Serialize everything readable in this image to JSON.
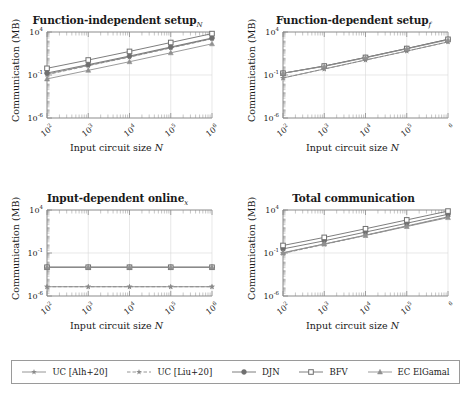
{
  "figure": {
    "width": 471,
    "height": 394,
    "background": "#ffffff",
    "line_color": "#808080",
    "axis_color": "#8c8c8c",
    "grid_color": "#d9d9d9",
    "text_color": "#1a1a1a"
  },
  "panels": [
    {
      "key": "function_independent_setup",
      "title": "Function-independent setup",
      "title_sub": "N",
      "xlabel_prefix": "Input circuit size ",
      "xlabel_italic": "N",
      "ylabel": "Communication (MB)",
      "xticks": [
        "10<sup>2</sup>",
        "10<sup>3</sup>",
        "10<sup>4</sup>",
        "10<sup>5</sup>",
        "10<sup>6</sup>"
      ],
      "yticks": [
        "10<sup>4</sup>",
        "10<sup>-1</sup>",
        "10<sup>-6</sup>"
      ]
    },
    {
      "key": "function_dependent_setup",
      "title": "Function-dependent setup",
      "title_sub": "f",
      "xlabel_prefix": "Input circuit size ",
      "xlabel_italic": "N",
      "ylabel": "Communication (MB)",
      "xticks": [
        "10<sup>2</sup>",
        "10<sup>3</sup>",
        "10<sup>4</sup>",
        "10<sup>5</sup>",
        "<sup>6</sup>"
      ],
      "yticks": [
        "10<sup>4</sup>",
        "10<sup>-1</sup>",
        "10<sup>-6</sup>"
      ]
    },
    {
      "key": "input_dependent_online",
      "title": "Input-dependent online",
      "title_sub": "x",
      "xlabel_prefix": "Input circuit size ",
      "xlabel_italic": "N",
      "ylabel": "Communication (MB)",
      "xticks": [
        "10<sup>2</sup>",
        "10<sup>3</sup>",
        "10<sup>4</sup>",
        "10<sup>5</sup>",
        "10<sup>6</sup>"
      ],
      "yticks": [
        "10<sup>4</sup>",
        "10<sup>-1</sup>",
        "10<sup>-6</sup>"
      ]
    },
    {
      "key": "total_communication",
      "title": "Total communication",
      "title_sub": "",
      "xlabel_prefix": "Input circuit size ",
      "xlabel_italic": "N",
      "ylabel": "Communication (MB)",
      "xticks": [
        "10<sup>2</sup>",
        "10<sup>3</sup>",
        "10<sup>4</sup>",
        "10<sup>5</sup>",
        "<sup>6</sup>"
      ],
      "yticks": [
        "10<sup>4</sup>",
        "10<sup>-1</sup>",
        "10<sup>-6</sup>"
      ]
    }
  ],
  "legend": {
    "entries": [
      {
        "label": "UC [Alh+20]",
        "marker": "star",
        "dash": "solid",
        "color": "#8a8a8a"
      },
      {
        "label": "UC [Liu+20]",
        "marker": "star",
        "dash": "dashed",
        "color": "#8a8a8a"
      },
      {
        "label": "DJN",
        "marker": "circle",
        "dash": "solid",
        "color": "#6f6f6f"
      },
      {
        "label": "BFV",
        "marker": "square",
        "dash": "solid",
        "color": "#6f6f6f"
      },
      {
        "label": "EC ElGamal",
        "marker": "triangle",
        "dash": "solid",
        "color": "#909090"
      }
    ]
  },
  "chart_data": [
    {
      "id": "function_independent_setup",
      "type": "line",
      "title": "Function-independent setup_N",
      "xlabel": "Input circuit size N",
      "ylabel": "Communication (MB)",
      "xscale": "log",
      "yscale": "log",
      "xlim": [
        100,
        1000000
      ],
      "ylim": [
        1e-06,
        10000
      ],
      "x": [
        100,
        1000,
        10000,
        100000,
        1000000
      ],
      "grid": true,
      "legend_position": "bottom-shared",
      "series": [
        {
          "name": "UC [Alh+20]",
          "values": [
            0.13,
            1.3,
            13,
            150,
            1700
          ]
        },
        {
          "name": "UC [Liu+20]",
          "values": [
            0.11,
            1.2,
            12,
            140,
            1600
          ]
        },
        {
          "name": "DJN",
          "values": [
            0.17,
            1.6,
            16,
            180,
            2000
          ]
        },
        {
          "name": "BFV",
          "values": [
            0.6,
            5.5,
            55,
            600,
            6500
          ]
        },
        {
          "name": "EC ElGamal",
          "values": [
            0.035,
            0.35,
            3.5,
            38,
            420
          ]
        }
      ]
    },
    {
      "id": "function_dependent_setup",
      "type": "line",
      "title": "Function-dependent setup_f",
      "xlabel": "Input circuit size N",
      "ylabel": "Communication (MB)",
      "xscale": "log",
      "yscale": "log",
      "xlim": [
        100,
        1000000
      ],
      "ylim": [
        1e-06,
        10000
      ],
      "x": [
        100,
        1000,
        10000,
        100000,
        1000000
      ],
      "grid": true,
      "legend_position": "bottom-shared",
      "series": [
        {
          "name": "UC [Alh+20]",
          "values": [
            0.045,
            0.5,
            5.5,
            60,
            700
          ]
        },
        {
          "name": "UC [Liu+20]",
          "values": [
            0.045,
            0.5,
            5.5,
            60,
            700
          ]
        },
        {
          "name": "DJN",
          "values": [
            0.16,
            1.1,
            11,
            120,
            1400
          ]
        },
        {
          "name": "BFV",
          "values": [
            0.16,
            1.1,
            11,
            120,
            1400
          ]
        },
        {
          "name": "EC ElGamal",
          "values": [
            0.16,
            1.0,
            10,
            110,
            1200
          ]
        }
      ]
    },
    {
      "id": "input_dependent_online",
      "type": "line",
      "title": "Input-dependent online_x",
      "xlabel": "Input circuit size N",
      "ylabel": "Communication (MB)",
      "xscale": "log",
      "yscale": "log",
      "xlim": [
        100,
        1000000
      ],
      "ylim": [
        1e-06,
        10000
      ],
      "x": [
        100,
        1000,
        10000,
        100000,
        1000000
      ],
      "grid": true,
      "legend_position": "bottom-shared",
      "series": [
        {
          "name": "UC [Alh+20]",
          "values": [
            1.2e-05,
            1.2e-05,
            1.2e-05,
            1.2e-05,
            1.2e-05
          ]
        },
        {
          "name": "UC [Liu+20]",
          "values": [
            1.2e-05,
            1.2e-05,
            1.2e-05,
            1.2e-05,
            1.2e-05
          ]
        },
        {
          "name": "DJN",
          "values": [
            0.0022,
            0.0022,
            0.0022,
            0.0022,
            0.0022
          ]
        },
        {
          "name": "BFV",
          "values": [
            0.0022,
            0.0022,
            0.0022,
            0.0022,
            0.0022
          ]
        },
        {
          "name": "EC ElGamal",
          "values": [
            0.0022,
            0.0022,
            0.0022,
            0.0022,
            0.0022
          ]
        }
      ]
    },
    {
      "id": "total_communication",
      "type": "line",
      "title": "Total communication",
      "xlabel": "Input circuit size N",
      "ylabel": "Communication (MB)",
      "xscale": "log",
      "yscale": "log",
      "xlim": [
        100,
        1000000
      ],
      "ylim": [
        1e-06,
        10000
      ],
      "x": [
        100,
        1000,
        10000,
        100000,
        1000000
      ],
      "grid": true,
      "legend_position": "bottom-shared",
      "series": [
        {
          "name": "UC [Alh+20]",
          "values": [
            0.1,
            1.1,
            12,
            140,
            1600
          ]
        },
        {
          "name": "UC [Liu+20]",
          "values": [
            0.09,
            1.0,
            11,
            130,
            1500
          ]
        },
        {
          "name": "DJN",
          "values": [
            0.3,
            2.6,
            27,
            290,
            3200
          ]
        },
        {
          "name": "BFV",
          "values": [
            0.75,
            6.5,
            66,
            700,
            7500
          ]
        },
        {
          "name": "EC ElGamal",
          "values": [
            0.11,
            1.1,
            11,
            120,
            1300
          ]
        }
      ]
    }
  ]
}
